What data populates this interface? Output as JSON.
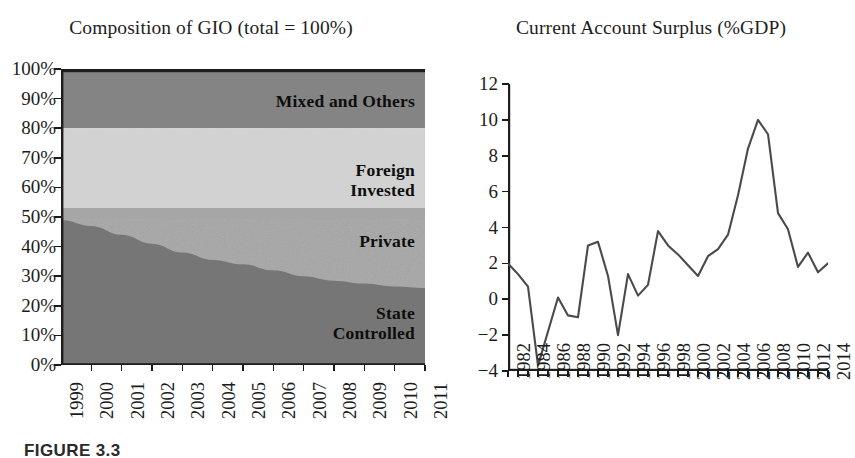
{
  "figure": {
    "caption": "FIGURE 3.3"
  },
  "panels": {
    "left": {
      "title": "Composition of GIO (total = 100%)",
      "band_labels": {
        "mixed": "Mixed and Others",
        "foreign_line1": "Foreign",
        "foreign_line2": "Invested",
        "private": "Private",
        "state_line1": "State",
        "state_line2": "Controlled"
      }
    },
    "right": {
      "title": "Current Account Surplus (%GDP)"
    }
  },
  "chart_data": [
    {
      "id": "composition-of-gio",
      "type": "area",
      "stacked": true,
      "title": "Composition of GIO (total = 100%)",
      "xlabel": "",
      "ylabel": "",
      "xlim": [
        1999,
        2011
      ],
      "ylim": [
        0,
        100
      ],
      "grid": false,
      "legend": "inline-band-labels",
      "x": [
        1999,
        2000,
        2001,
        2002,
        2003,
        2004,
        2005,
        2006,
        2007,
        2008,
        2009,
        2010,
        2011
      ],
      "ytick_labels": [
        "0%",
        "10%",
        "20%",
        "30%",
        "40%",
        "50%",
        "60%",
        "70%",
        "80%",
        "90%",
        "100%"
      ],
      "ytick_values": [
        0,
        10,
        20,
        30,
        40,
        50,
        60,
        70,
        80,
        90,
        100
      ],
      "xtick_labels": [
        "1999",
        "2000",
        "2001",
        "2002",
        "2003",
        "2004",
        "2005",
        "2006",
        "2007",
        "2008",
        "2009",
        "2010",
        "2011"
      ],
      "series": [
        {
          "name": "State Controlled",
          "color": "#767676",
          "values": [
            49,
            47,
            44,
            41,
            38,
            35.5,
            34,
            32,
            30,
            28.5,
            27.5,
            26.5,
            26
          ]
        },
        {
          "name": "Private",
          "color": "#a6a6a6",
          "values": [
            4,
            6,
            9,
            12,
            15,
            17.5,
            19,
            21,
            23,
            24.5,
            25.5,
            26.5,
            27
          ]
        },
        {
          "name": "Foreign Invested",
          "color": "#d2d2d2",
          "values": [
            27,
            27,
            27,
            27,
            27,
            27,
            27,
            27,
            27,
            27,
            27,
            27,
            27
          ]
        },
        {
          "name": "Mixed and Others",
          "color": "#848484",
          "values": [
            20,
            20,
            20,
            20,
            20,
            20,
            20,
            20,
            20,
            20,
            20,
            20,
            20
          ]
        }
      ],
      "band_boundaries_pct": {
        "state_top": [
          49,
          47,
          44,
          41,
          38,
          35.5,
          34,
          32,
          30,
          28.5,
          27.5,
          26.5,
          26
        ],
        "private_top": 53,
        "foreign_top": 80,
        "mixed_top": 100
      }
    },
    {
      "id": "current-account-surplus",
      "type": "line",
      "title": "Current Account Surplus (%GDP)",
      "xlabel": "",
      "ylabel": "",
      "xlim": [
        1982,
        2014
      ],
      "ylim": [
        -4,
        12
      ],
      "grid": false,
      "legend": "none",
      "line_color": "#4a4a4a",
      "ytick_labels": [
        "−4",
        "−2",
        "0",
        "2",
        "4",
        "6",
        "8",
        "10",
        "12"
      ],
      "ytick_values": [
        -4,
        -2,
        0,
        2,
        4,
        6,
        8,
        10,
        12
      ],
      "xtick_labels": [
        "1982",
        "1984",
        "1986",
        "1988",
        "1990",
        "1992",
        "1994",
        "1996",
        "1998",
        "2000",
        "2002",
        "2004",
        "2006",
        "2008",
        "2010",
        "2012",
        "2014"
      ],
      "x": [
        1982,
        1983,
        1984,
        1985,
        1986,
        1987,
        1988,
        1989,
        1990,
        1991,
        1992,
        1993,
        1994,
        1995,
        1996,
        1997,
        1998,
        1999,
        2000,
        2001,
        2002,
        2003,
        2004,
        2005,
        2006,
        2007,
        2008,
        2009,
        2010,
        2011,
        2012,
        2013,
        2014
      ],
      "values": [
        2.0,
        1.4,
        0.7,
        -3.7,
        -1.8,
        0.1,
        -0.9,
        -1.0,
        3.0,
        3.2,
        1.3,
        -2.0,
        1.4,
        0.2,
        0.8,
        3.8,
        3.0,
        2.5,
        1.9,
        1.3,
        2.4,
        2.8,
        3.6,
        5.8,
        8.4,
        10.0,
        9.2,
        4.8,
        3.9,
        1.8,
        2.6,
        1.5,
        2.0
      ]
    }
  ]
}
